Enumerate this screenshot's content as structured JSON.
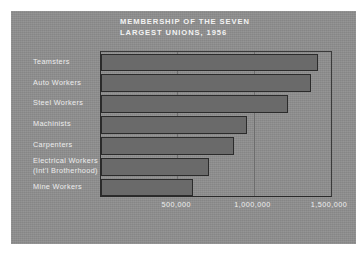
{
  "card": {
    "background_color": "#8e8e8e",
    "bar_fill_color": "#6a6a6a",
    "bar_outline_color": "#2b2b2b",
    "text_color": "#f0f0f0"
  },
  "title": {
    "line1": "MEMBERSHIP OF THE SEVEN",
    "line2": "LARGEST UNIONS, 1956"
  },
  "chart_data": {
    "type": "bar",
    "orientation": "horizontal",
    "title": "MEMBERSHIP OF THE SEVEN LARGEST UNIONS, 1956",
    "xlabel": "",
    "ylabel": "",
    "categories": [
      "Teamsters",
      "Auto Workers",
      "Steel Workers",
      "Machinists",
      "Carpenters",
      "Electrical Workers (Int'l Brotherhood)",
      "Mine Workers"
    ],
    "category_labels": [
      {
        "line1": "Teamsters",
        "line2": ""
      },
      {
        "line1": "Auto Workers",
        "line2": ""
      },
      {
        "line1": "Steel Workers",
        "line2": ""
      },
      {
        "line1": "Machinists",
        "line2": ""
      },
      {
        "line1": "Carpenters",
        "line2": ""
      },
      {
        "line1": "Electrical Workers",
        "line2": "(Int'l Brotherhood)"
      },
      {
        "line1": "Mine Workers",
        "line2": ""
      }
    ],
    "values": [
      1420000,
      1375000,
      1225000,
      955000,
      870000,
      705000,
      605000
    ],
    "xlim": [
      0,
      1520000
    ],
    "xticks": [
      500000,
      1000000,
      1500000
    ],
    "xtick_labels": [
      "500,000",
      "1,000,000",
      "1,500,000"
    ],
    "grid": true,
    "gridlines_at": [
      500000,
      1000000
    ],
    "legend": null
  }
}
